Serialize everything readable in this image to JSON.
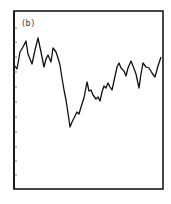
{
  "chart_data": {
    "type": "line",
    "title": "",
    "panel_label": "(b)",
    "xlabel": "",
    "ylabel": "",
    "grid": false,
    "legend": null,
    "ytick_count": 11,
    "frame": {
      "left": 14,
      "top": 11,
      "right": 163,
      "bottom": 189
    },
    "ytick_pixels": [
      28,
      42,
      57,
      72,
      87,
      102,
      117,
      132,
      147,
      161,
      175
    ],
    "series": [
      {
        "name": "series",
        "color": "#111111",
        "points_px": [
          [
            15,
            66
          ],
          [
            17,
            69
          ],
          [
            20,
            52
          ],
          [
            23,
            47
          ],
          [
            26,
            41
          ],
          [
            28,
            54
          ],
          [
            32,
            64
          ],
          [
            35,
            50
          ],
          [
            38,
            38
          ],
          [
            41,
            52
          ],
          [
            44,
            67
          ],
          [
            46,
            59
          ],
          [
            48,
            55
          ],
          [
            51,
            62
          ],
          [
            53,
            48
          ],
          [
            56,
            52
          ],
          [
            58,
            58
          ],
          [
            60,
            65
          ],
          [
            62,
            78
          ],
          [
            64,
            90
          ],
          [
            66,
            100
          ],
          [
            68,
            113
          ],
          [
            70,
            127
          ],
          [
            72,
            122
          ],
          [
            74,
            118
          ],
          [
            77,
            112
          ],
          [
            79,
            114
          ],
          [
            81,
            107
          ],
          [
            84,
            98
          ],
          [
            87,
            82
          ],
          [
            89,
            91
          ],
          [
            91,
            90
          ],
          [
            93,
            95
          ],
          [
            96,
            99
          ],
          [
            98,
            97
          ],
          [
            100,
            101
          ],
          [
            102,
            92
          ],
          [
            104,
            86
          ],
          [
            106,
            88
          ],
          [
            108,
            83
          ],
          [
            110,
            87
          ],
          [
            112,
            90
          ],
          [
            114,
            81
          ],
          [
            117,
            67
          ],
          [
            119,
            63
          ],
          [
            121,
            68
          ],
          [
            124,
            71
          ],
          [
            126,
            76
          ],
          [
            128,
            68
          ],
          [
            131,
            61
          ],
          [
            133,
            66
          ],
          [
            136,
            74
          ],
          [
            139,
            88
          ],
          [
            141,
            74
          ],
          [
            143,
            63
          ],
          [
            146,
            67
          ],
          [
            149,
            68
          ],
          [
            152,
            73
          ],
          [
            155,
            77
          ],
          [
            158,
            66
          ],
          [
            161,
            57
          ]
        ]
      }
    ]
  }
}
